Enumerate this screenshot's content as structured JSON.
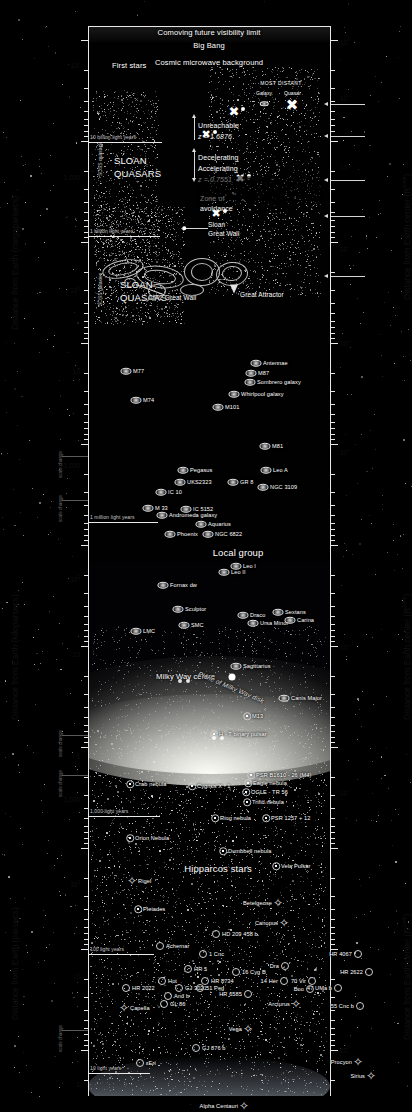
{
  "figure": {
    "type": "scatter",
    "left_axis_title_top": "Distance from Earth (megaparsecs)",
    "left_axis_title_mid": "Distance from Earth (kiloparsecs)",
    "left_axis_title_bottom": "Distance from Earth (parsecs)",
    "right_axis_title": "Distance from Earth center (Rₑₐᵣₜₕ)",
    "scale_change_label": "scale change"
  },
  "chart_data": {
    "type": "scatter",
    "xlabel": "",
    "ylabel": "Distance from Earth (megaparsecs / kiloparsecs / parsecs)",
    "y2label": "Distance from Earth center (R_Earth)",
    "scale": "log",
    "grid": false,
    "legend": "none",
    "left_ticks_mpc": [
      "10⁴",
      "1,000",
      "100",
      "10"
    ],
    "left_ticks_kpc": [
      "1,000",
      "100",
      "10",
      "1"
    ],
    "left_ticks_pc": [
      "1,000",
      "100",
      "10",
      "1"
    ],
    "right_ticks": [
      "10²⁰",
      "10¹⁹",
      "10¹⁸",
      "10¹⁷",
      "10¹⁶",
      "10¹⁵",
      "10¹¹",
      "10¹⁰",
      "10⁹"
    ],
    "redshifts": [
      {
        "label": "Unreachable",
        "value": "z = 1.6876"
      },
      {
        "label": "Decelerating / Accelerating",
        "value": "z = 0.7551"
      }
    ],
    "distance_rulers": [
      "10 billion light years",
      "1 billion light years",
      "1 million light years",
      "1,000 light years",
      "100 light years",
      "10 light years"
    ]
  },
  "cosmological": {
    "comoving_limit": "Comoving future visibility limit",
    "big_bang": "Big Bang",
    "cmb": "Cosmic microwave background",
    "first_stars": "First stars",
    "most_distant_header": "MOST DISTANT",
    "most_distant_galaxy": "Galaxy",
    "most_distant_quasar": "Quasar",
    "unreachable": "Unreachable",
    "unreachable_z": "z = 1.6876",
    "decelerating": "Decelerating",
    "accelerating": "Accelerating",
    "accel_z": "z = 0.7551",
    "zone_of_avoidance": "Zone of avoidance",
    "sloan_quasars": "SLOAN QUASARS",
    "sdss_quasars_axis": "SDSS quasars",
    "sdss_galaxies_axis": "SDSS galaxies",
    "sloan_great_wall": "Sloan Great Wall",
    "cfa2_great_wall": "CfA2 Great Wall",
    "great_attractor": "Great Attractor",
    "local_group": "Local group",
    "hipparcos_stars": "Hipparcos stars",
    "plane_of_milky_way_disk": "Plane of Milky Way disk",
    "milky_way_centre": "Milky Way centre"
  },
  "rulers": {
    "r10gly": "10 billion light years",
    "r1gly": "1 billion light years",
    "r1mly": "1 million light years",
    "r1kly": "1,000 light years",
    "r100ly": "100 light years",
    "r10ly": "10 light years"
  },
  "galaxies": [
    {
      "name": "M77",
      "x": 38,
      "y": 345
    },
    {
      "name": "M74",
      "x": 48,
      "y": 374
    },
    {
      "name": "Antennae",
      "x": 168,
      "y": 337
    },
    {
      "name": "M87",
      "x": 163,
      "y": 347
    },
    {
      "name": "Sombrero galaxy",
      "x": 162,
      "y": 356
    },
    {
      "name": "Whirlpool galaxy",
      "x": 146,
      "y": 368
    },
    {
      "name": "M101",
      "x": 130,
      "y": 381
    },
    {
      "name": "M81",
      "x": 177,
      "y": 420
    },
    {
      "name": "Leo A",
      "x": 178,
      "y": 444
    },
    {
      "name": "GR 8",
      "x": 145,
      "y": 456
    },
    {
      "name": "NGC 3109",
      "x": 175,
      "y": 461
    },
    {
      "name": "Pegasus",
      "x": 95,
      "y": 444
    },
    {
      "name": "UKS2323",
      "x": 92,
      "y": 456
    },
    {
      "name": "IC 10",
      "x": 73,
      "y": 466
    },
    {
      "name": "M 33",
      "x": 60,
      "y": 482
    },
    {
      "name": "Andromeda galaxy",
      "x": 74,
      "y": 489
    },
    {
      "name": "IC 5152",
      "x": 98,
      "y": 483
    },
    {
      "name": "Aquarius",
      "x": 113,
      "y": 498
    },
    {
      "name": "Phoenix",
      "x": 82,
      "y": 508
    },
    {
      "name": "NGC 6822",
      "x": 120,
      "y": 508
    },
    {
      "name": "Leo I",
      "x": 148,
      "y": 540
    },
    {
      "name": "Leo II",
      "x": 136,
      "y": 546
    },
    {
      "name": "Fornax dw",
      "x": 75,
      "y": 559
    },
    {
      "name": "Sculptor",
      "x": 90,
      "y": 583
    },
    {
      "name": "SMC",
      "x": 96,
      "y": 599
    },
    {
      "name": "LMC",
      "x": 48,
      "y": 605
    },
    {
      "name": "Draco",
      "x": 155,
      "y": 589
    },
    {
      "name": "Ursa Minor",
      "x": 165,
      "y": 597
    },
    {
      "name": "Sextans",
      "x": 190,
      "y": 586
    },
    {
      "name": "Carina",
      "x": 202,
      "y": 594
    },
    {
      "name": "Sagittarius",
      "x": 148,
      "y": 640
    },
    {
      "name": "Canis Major",
      "x": 196,
      "y": 672
    }
  ],
  "deep_sky": [
    {
      "name": "M13",
      "x": 159,
      "y": 690
    },
    {
      "name": "H - T binary pulsar",
      "x": 126,
      "y": 708
    },
    {
      "name": "Crab nebula",
      "x": 42,
      "y": 758
    },
    {
      "name": "Cygnus X - 1",
      "x": 104,
      "y": 760
    },
    {
      "name": "Eagle nebula",
      "x": 160,
      "y": 757
    },
    {
      "name": "PSR B1610 - 26 (M4)",
      "x": 163,
      "y": 749
    },
    {
      "name": "OGLE - TR 56",
      "x": 158,
      "y": 766
    },
    {
      "name": "Trifid nebula",
      "x": 159,
      "y": 776
    },
    {
      "name": "Ring nebula",
      "x": 127,
      "y": 792
    },
    {
      "name": "PSR 1257 + 12",
      "x": 178,
      "y": 792
    },
    {
      "name": "Orion Nebula",
      "x": 42,
      "y": 812
    },
    {
      "name": "Dumbbell nebula",
      "x": 135,
      "y": 825
    },
    {
      "name": "Vela Pulsar",
      "x": 188,
      "y": 840
    },
    {
      "name": "Pleiades",
      "x": 50,
      "y": 883
    }
  ],
  "stars": [
    {
      "name": "Rigel",
      "x": 44,
      "y": 855
    },
    {
      "name": "Betelgeuse",
      "x": 190,
      "y": 877
    },
    {
      "name": "Canopus",
      "x": 196,
      "y": 897
    },
    {
      "name": "Achernar",
      "x": 72,
      "y": 920
    },
    {
      "name": "HD 209 458 b",
      "x": 128,
      "y": 908
    },
    {
      "name": "1 Cnc",
      "x": 115,
      "y": 928
    },
    {
      "name": "HR 5",
      "x": 100,
      "y": 943
    },
    {
      "name": "16 Cyg B",
      "x": 148,
      "y": 946
    },
    {
      "name": "Dra",
      "x": 197,
      "y": 940
    },
    {
      "name": "HR 4067",
      "x": 270,
      "y": 928
    },
    {
      "name": "HR 2622",
      "x": 281,
      "y": 946
    },
    {
      "name": "HR 8734",
      "x": 117,
      "y": 955
    },
    {
      "name": "Hot",
      "x": 74,
      "y": 955
    },
    {
      "name": "HR 2022",
      "x": 38,
      "y": 962
    },
    {
      "name": "GJ 3021",
      "x": 91,
      "y": 962
    },
    {
      "name": "51 Peg",
      "x": 112,
      "y": 962
    },
    {
      "name": "14 Her",
      "x": 196,
      "y": 955
    },
    {
      "name": "70 Vir",
      "x": 224,
      "y": 955
    },
    {
      "name": "Boo",
      "x": 222,
      "y": 963
    },
    {
      "name": "HR 6585",
      "x": 160,
      "y": 968
    },
    {
      "name": "47 UMa b",
      "x": 250,
      "y": 962
    },
    {
      "name": "And b",
      "x": 80,
      "y": 970
    },
    {
      "name": "GL 86",
      "x": 76,
      "y": 978
    },
    {
      "name": "Capella",
      "x": 36,
      "y": 982
    },
    {
      "name": "Arcturus",
      "x": 208,
      "y": 978
    },
    {
      "name": "55 Cnc b",
      "x": 272,
      "y": 980
    },
    {
      "name": "Vega",
      "x": 160,
      "y": 1003
    },
    {
      "name": "GJ 876 b",
      "x": 108,
      "y": 1022
    },
    {
      "name": "εEri",
      "x": 52,
      "y": 1037
    },
    {
      "name": "Procyon",
      "x": 270,
      "y": 1036
    },
    {
      "name": "Sirius",
      "x": 283,
      "y": 1050
    },
    {
      "name": "Alpha Centauri",
      "x": 156,
      "y": 1080
    },
    {
      "name": "Proxima Centauri",
      "x": 200,
      "y": 1093
    }
  ]
}
